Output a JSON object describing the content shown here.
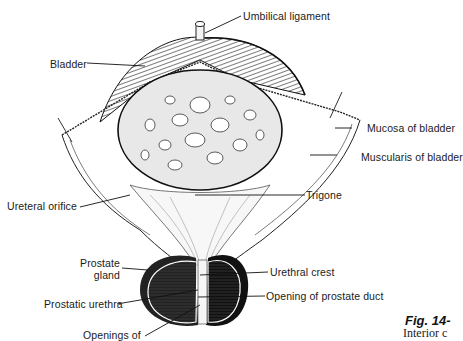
{
  "figure": {
    "number": "Fig. 14-",
    "caption": "Interior c"
  },
  "labels": {
    "umbilical_ligament": "Umbilical ligament",
    "bladder": "Bladder",
    "mucosa_of_bladder": "Mucosa of bladder",
    "muscularis_of_bladder": "Muscularis of bladder",
    "ureteral_orifice": "Ureteral orifice",
    "trigone": "Trigone",
    "prostate_gland_line1": "Prostate",
    "prostate_gland_line2": "gland",
    "urethral_crest": "Urethral crest",
    "prostatic_urethra": "Prostatic urethra",
    "opening_of_prostate_duct": "Opening of prostate duct",
    "openings_of": "Openings of"
  },
  "colors": {
    "ink": "#1a1a1a",
    "background": "#ffffff"
  }
}
